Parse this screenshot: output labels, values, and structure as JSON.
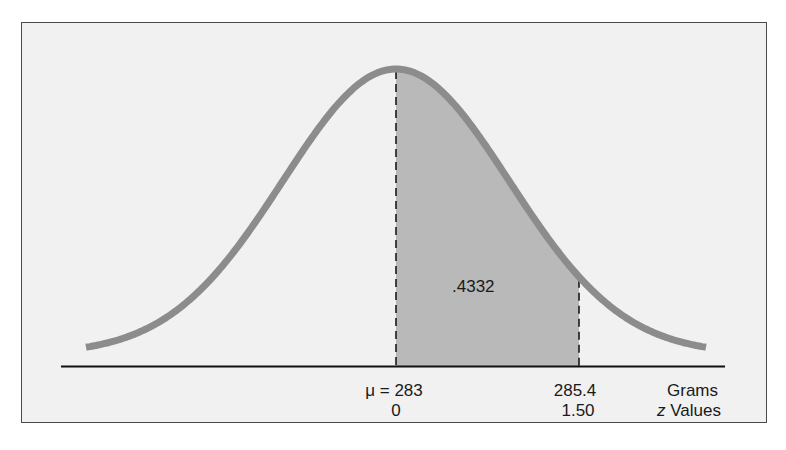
{
  "chart_data": {
    "type": "area",
    "title": "",
    "distribution": {
      "mean": 283,
      "value": 285.4,
      "z": 1.5
    },
    "shaded_region": {
      "from_z": 0,
      "to_z": 1.5,
      "area": 0.4332,
      "label": ".4332"
    },
    "x_axis": {
      "rows": [
        {
          "name": "Grams",
          "ticks": [
            {
              "z": 0,
              "label": "μ = 283"
            },
            {
              "z": 1.5,
              "label": "285.4"
            }
          ],
          "unit_label": "Grams"
        },
        {
          "name": "z Values",
          "ticks": [
            {
              "z": 0,
              "label": "0"
            },
            {
              "z": 1.5,
              "label": "1.50"
            }
          ],
          "unit_label": "z Values"
        }
      ]
    },
    "grid": false,
    "legend": null
  },
  "labels": {
    "area": ".4332",
    "mean_grams": "μ = 283",
    "value_grams": "285.4",
    "unit_grams": "Grams",
    "mean_z": "0",
    "value_z": "1.50",
    "unit_z_italic": "z",
    "unit_z_rest": " Values"
  },
  "colors": {
    "background": "#f1f1f1",
    "frame": "#4a4a4a",
    "curve": "#8c8c8c",
    "shade": "#b9b9b9",
    "axis": "#111111",
    "dash": "#1a1a1a",
    "text": "#1a1a1a"
  }
}
